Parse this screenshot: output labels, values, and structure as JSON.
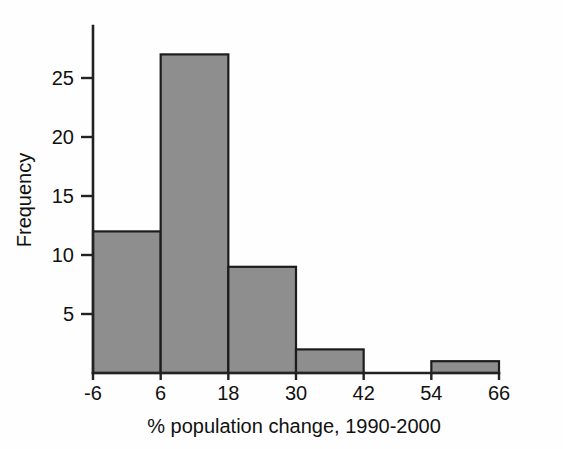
{
  "chart_data": {
    "type": "bar",
    "title": "",
    "subtitle": "",
    "xlabel": "% population change, 1990-2000",
    "ylabel": "Frequency",
    "bin_edges": [
      -6,
      6,
      18,
      30,
      42,
      54,
      66
    ],
    "bin_width": 12,
    "categories": [
      "-6 to 6",
      "6 to 18",
      "18 to 30",
      "30 to 42",
      "42 to 54",
      "54 to 66"
    ],
    "values": [
      12,
      27,
      9,
      2,
      0,
      1
    ],
    "x_tick_labels": [
      "-6",
      "6",
      "18",
      "30",
      "42",
      "54",
      "66"
    ],
    "x_tick_values": [
      -6,
      6,
      18,
      30,
      42,
      54,
      66
    ],
    "y_tick_labels": [
      "5",
      "10",
      "15",
      "20",
      "25"
    ],
    "y_tick_values": [
      5,
      10,
      15,
      20,
      25
    ],
    "xlim": [
      -6,
      66
    ],
    "ylim": [
      0,
      29
    ],
    "grid": false,
    "legend": false,
    "bar_fill_color": "#8e8e8e",
    "bar_edge_color": "#1c1c1c",
    "axis_color": "#222222",
    "background_color": "#fefefe"
  },
  "axes": {
    "y_title": "Frequency",
    "x_title": "% population change, 1990-2000"
  }
}
